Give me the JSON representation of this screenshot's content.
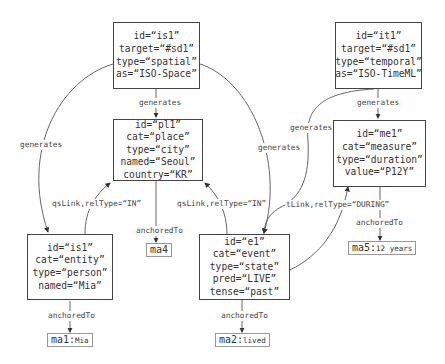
{
  "nodes": {
    "is1_top": {
      "lines": [
        "id=“is1”",
        "target=“#sd1”",
        "type=“spatial”",
        "as=“ISO-Space”"
      ]
    },
    "it1": {
      "lines": [
        "id=“it1”",
        "target=“#sd1”",
        "type=“temporal”",
        "as=“ISO-TimeML”"
      ]
    },
    "pl1": {
      "lines": [
        "id=“pl1”",
        "cat=“place”",
        "type=“city”",
        "named=“Seoul”",
        "country=“KR”"
      ]
    },
    "me1": {
      "lines": [
        "id=“me1”",
        "cat=“measure”",
        "type=“duration”",
        "value=“P12Y”"
      ]
    },
    "is1_person": {
      "lines": [
        "id=“is1”",
        "cat=“entity”",
        "type=“person”",
        "named=“Mia”"
      ]
    },
    "e1": {
      "lines": [
        "id=“e1”",
        "cat=“event”",
        "type=“state”",
        "pred=“LIVE”",
        "tense=“past”"
      ]
    }
  },
  "anchors": {
    "ma1": {
      "id": "ma1:",
      "text": "Mia"
    },
    "ma2": {
      "id": "ma2:",
      "text": "lived"
    },
    "ma4": {
      "id": "ma4",
      "text": ""
    },
    "ma5": {
      "id": "ma5:",
      "text": "12 years"
    }
  },
  "edge_labels": {
    "gen_is1_pl1": "generates",
    "gen_is1_person": "generates",
    "gen_is1_e1": "generates",
    "gen_it1_me1": "generates",
    "gen_it1_e1": "generates",
    "qslink_person": "qsLink,relType=“IN”",
    "qslink_e1": "qsLink,relType=“IN”",
    "tlink_e1": "tLink,relType=“DURING”",
    "anch_pl1": "anchoredTo",
    "anch_person": "anchoredTo",
    "anch_e1": "anchoredTo",
    "anch_me1": "anchoredTo"
  },
  "colors": {
    "stroke": "#444444",
    "line": "#555555",
    "anchor_border": "#999999"
  }
}
